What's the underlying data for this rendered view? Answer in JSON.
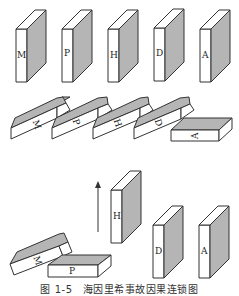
{
  "diagram": {
    "rows": [
      {
        "name": "standing-row",
        "dominoes": [
          "M",
          "P",
          "H",
          "D",
          "A"
        ]
      },
      {
        "name": "fallen-row",
        "dominoes": [
          "M",
          "P",
          "H",
          "D",
          "A"
        ]
      },
      {
        "name": "removed-H-row",
        "fallen": [
          "M",
          "P"
        ],
        "lifted": "H",
        "standing": [
          "D",
          "A"
        ],
        "arrow": "up"
      }
    ],
    "labels": {
      "row1": [
        "M",
        "P",
        "H",
        "D",
        "A"
      ],
      "row2": [
        "M",
        "P",
        "H",
        "D",
        "A"
      ],
      "row3_fallen": [
        "M",
        "P"
      ],
      "row3_lifted": "H",
      "row3_standing": [
        "D",
        "A"
      ]
    },
    "colors": {
      "shade": "#b5b5b5",
      "stroke": "#333333",
      "face": "#ffffff"
    }
  },
  "caption": "图 1-5　海因里希事故因果连锁图"
}
